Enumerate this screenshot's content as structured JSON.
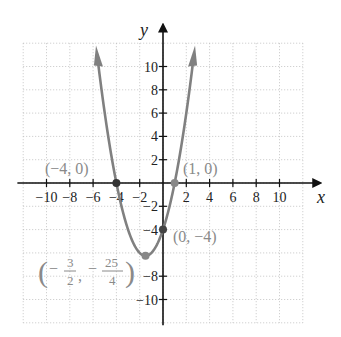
{
  "chart_data": {
    "type": "line",
    "title": "",
    "function": "y = x^2 + 3x - 4",
    "xlabel": "x",
    "ylabel": "y",
    "xlim": [
      -12,
      12
    ],
    "ylim": [
      -12,
      12
    ],
    "grid": true,
    "grid_step": 2,
    "x_ticks": [
      -10,
      -8,
      -6,
      -4,
      -2,
      2,
      4,
      6,
      8,
      10
    ],
    "y_ticks": [
      -10,
      -8,
      -4,
      -2,
      2,
      4,
      6,
      8,
      10
    ],
    "x_tick_labels": [
      "−10",
      "−8",
      "−6",
      "−4",
      "−2",
      "2",
      "4",
      "6",
      "8",
      "10"
    ],
    "y_tick_labels": [
      "10",
      "8",
      "6",
      "4",
      "2",
      "−2",
      "−4",
      "−8",
      "−10"
    ],
    "series": [
      {
        "name": "parabola",
        "color": "#808080",
        "x": [
          -5.6,
          -5,
          -4,
          -3,
          -2,
          -1.5,
          -1,
          0,
          1,
          2,
          2.6
        ],
        "y": [
          10.56,
          6,
          0,
          -4,
          -6,
          -6.25,
          -6,
          -4,
          0,
          6,
          11.56
        ]
      }
    ],
    "points": [
      {
        "x": -4,
        "y": 0,
        "label": "(−4, 0)"
      },
      {
        "x": 1,
        "y": 0,
        "label": "(1, 0)"
      },
      {
        "x": 0,
        "y": -4,
        "label": "(0, −4)"
      },
      {
        "x": -1.5,
        "y": -6.25,
        "label": "(−3/2, −25/4)"
      }
    ],
    "annotations": {
      "vertex_label": {
        "num1": "3",
        "den1": "2",
        "num2": "25",
        "den2": "4"
      }
    }
  },
  "labels": {
    "x_axis": "x",
    "y_axis": "y",
    "pt_neg4_0": "(−4, 0)",
    "pt_1_0": "(1, 0)",
    "pt_0_neg4": "(0, −4)",
    "vertex_num1": "3",
    "vertex_den1": "2",
    "vertex_num2": "25",
    "vertex_den2": "4"
  }
}
